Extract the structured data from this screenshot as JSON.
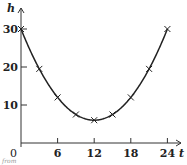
{
  "chart_data": {
    "type": "line",
    "title": "",
    "xlabel": "t",
    "ylabel": "h",
    "x": [
      0,
      3,
      6,
      9,
      12,
      15,
      18,
      21,
      24
    ],
    "series": [
      {
        "name": "h",
        "values": [
          30,
          19.5,
          12,
          7.5,
          6,
          7.5,
          12,
          19.5,
          30
        ],
        "marker": "x",
        "smooth": true
      }
    ],
    "xticks": [
      0,
      6,
      12,
      18,
      24
    ],
    "yticks": [
      10,
      20,
      30
    ],
    "xlim": [
      0,
      25
    ],
    "ylim": [
      0,
      33
    ],
    "grid": false,
    "legend": null
  },
  "labels": {
    "x_axis": "t",
    "y_axis": "h",
    "origin": "0",
    "xtick_labels": [
      "6",
      "12",
      "18",
      "24"
    ],
    "ytick_labels": [
      "10",
      "20",
      "30"
    ],
    "cropped_caption": "from"
  }
}
